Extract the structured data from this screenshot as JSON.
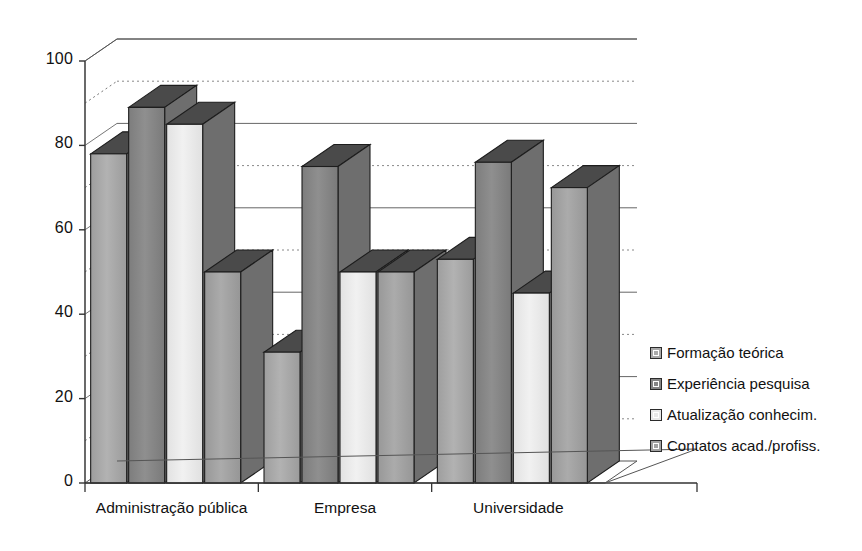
{
  "chart_data": {
    "type": "bar",
    "title": "",
    "subtitle": "",
    "xlabel": "",
    "ylabel": "",
    "ylim": [
      0,
      100
    ],
    "yticks": [
      0,
      20,
      40,
      60,
      80,
      100
    ],
    "minor_gridlines": [
      10,
      30,
      50,
      70,
      90
    ],
    "grid": true,
    "three_d": true,
    "legend_position": "right",
    "categories": [
      "Administração pública",
      "Empresa",
      "Universidade"
    ],
    "series": [
      {
        "name": "Formação teórica",
        "values": [
          78,
          31,
          53
        ],
        "color": "#a9a9a9"
      },
      {
        "name": "Experiência pesquisa",
        "values": [
          89,
          75,
          76
        ],
        "color": "#858585"
      },
      {
        "name": "Atualização conhecim.",
        "values": [
          85,
          50,
          45
        ],
        "color": "#e9e9e9"
      },
      {
        "name": "Contatos acad./profiss.",
        "values": [
          50,
          50,
          70
        ],
        "color": "#a2a2a2"
      }
    ]
  },
  "axis": {
    "y_tick_labels": [
      "0",
      "20",
      "40",
      "60",
      "80",
      "100"
    ],
    "x_tick_labels": [
      "Administração pública",
      "Empresa",
      "Universidade"
    ]
  },
  "legend": {
    "items": [
      {
        "label": "Formação teórica"
      },
      {
        "label": "Experiência pesquisa"
      },
      {
        "label": "Atualização conhecim."
      },
      {
        "label": "Contatos acad./profiss."
      }
    ]
  }
}
